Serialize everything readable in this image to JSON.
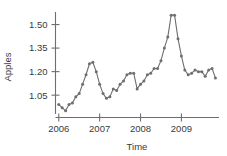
{
  "chart_data": {
    "type": "line",
    "title": "",
    "xlabel": "Time",
    "ylabel": "Apples",
    "xlim": [
      2005.92,
      2009.92
    ],
    "ylim": [
      0.93,
      1.58
    ],
    "grid": false,
    "legend": null,
    "marker": "circle",
    "line_color": "#6e6e6e",
    "marker_color": "#6e6e6e",
    "x_ticks": [
      2006,
      2007,
      2008,
      2009
    ],
    "x_tick_labels": [
      "2006",
      "2007",
      "2008",
      "2009"
    ],
    "y_ticks": [
      1.05,
      1.2,
      1.35,
      1.5
    ],
    "y_tick_labels": [
      "1.05",
      "1.20",
      "1.35",
      "1.50"
    ],
    "series": [
      {
        "name": "Apples",
        "x": [
          2006.0,
          2006.083,
          2006.167,
          2006.25,
          2006.333,
          2006.417,
          2006.5,
          2006.583,
          2006.667,
          2006.75,
          2006.833,
          2006.917,
          2007.0,
          2007.083,
          2007.167,
          2007.25,
          2007.333,
          2007.417,
          2007.5,
          2007.583,
          2007.667,
          2007.75,
          2007.833,
          2007.917,
          2008.0,
          2008.083,
          2008.167,
          2008.25,
          2008.333,
          2008.417,
          2008.5,
          2008.583,
          2008.667,
          2008.75,
          2008.833,
          2008.917,
          2009.0,
          2009.083,
          2009.167,
          2009.25,
          2009.333,
          2009.417,
          2009.5,
          2009.583,
          2009.667,
          2009.75,
          2009.833
        ],
        "values": [
          0.99,
          0.97,
          0.95,
          0.99,
          1.0,
          1.04,
          1.06,
          1.12,
          1.18,
          1.25,
          1.26,
          1.2,
          1.12,
          1.06,
          1.03,
          1.04,
          1.09,
          1.08,
          1.12,
          1.14,
          1.18,
          1.19,
          1.19,
          1.09,
          1.12,
          1.14,
          1.18,
          1.19,
          1.22,
          1.22,
          1.27,
          1.35,
          1.42,
          1.56,
          1.56,
          1.41,
          1.3,
          1.21,
          1.18,
          1.19,
          1.21,
          1.2,
          1.2,
          1.17,
          1.21,
          1.22,
          1.16
        ]
      }
    ]
  },
  "axes": {
    "y_label": "Apples",
    "x_label": "Time"
  }
}
